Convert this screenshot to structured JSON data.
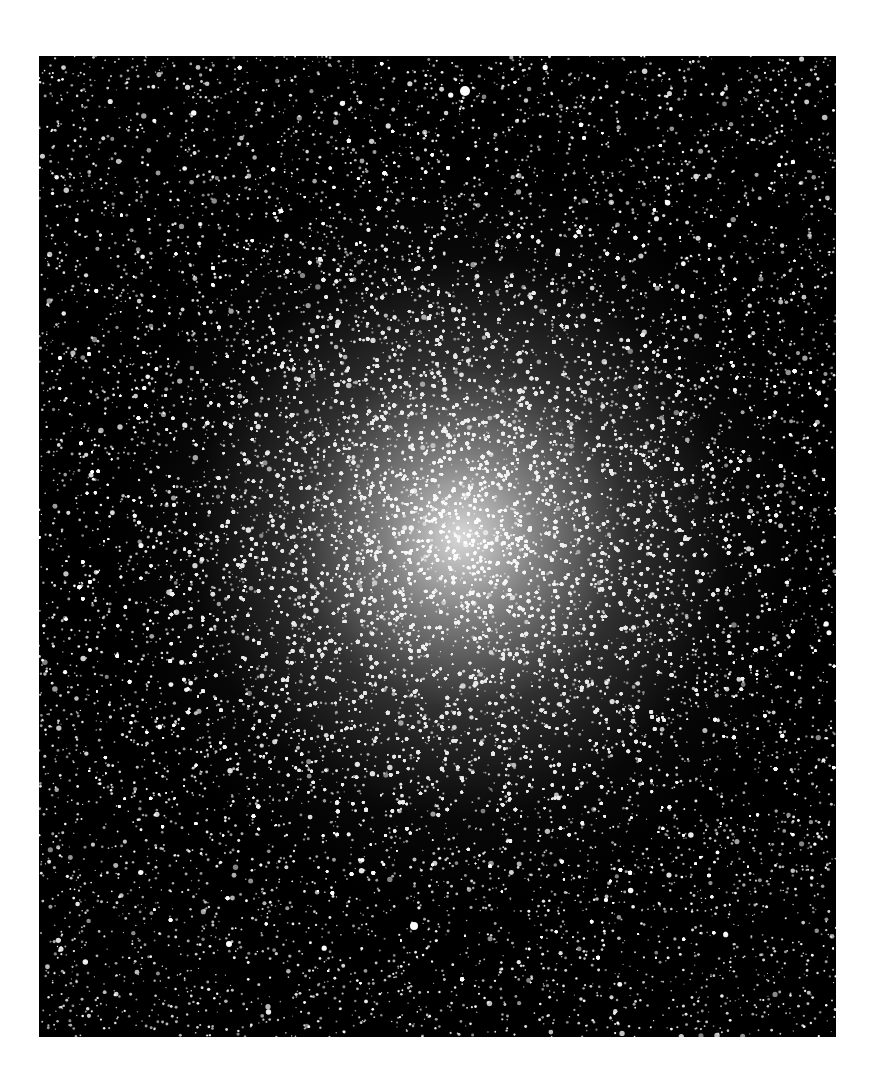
{
  "image": {
    "subject": "globular star cluster",
    "background_color": "#ffffff",
    "field_color": "#000000",
    "star_color": "#ffffff",
    "frame": {
      "left": 39,
      "top": 56,
      "width": 797,
      "height": 981
    },
    "core_center_relative": {
      "x": 0.53,
      "y": 0.49
    },
    "bright_stars": [
      {
        "x": 426,
        "y": 35,
        "r": 5
      },
      {
        "x": 375,
        "y": 870,
        "r": 4
      },
      {
        "x": 190,
        "y": 888,
        "r": 3
      }
    ]
  }
}
